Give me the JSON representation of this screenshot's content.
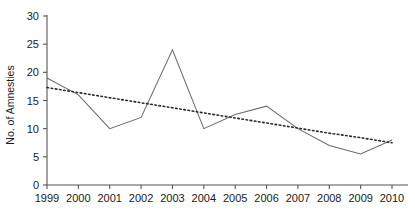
{
  "chart_data": {
    "type": "line",
    "title": "",
    "xlabel": "",
    "ylabel": "No. of Amnesties",
    "categories": [
      "1999",
      "2000",
      "2001",
      "2002",
      "2003",
      "2004",
      "2005",
      "2006",
      "2007",
      "2008",
      "2009",
      "2010"
    ],
    "x": [
      1999,
      2000,
      2001,
      2002,
      2003,
      2004,
      2005,
      2006,
      2007,
      2008,
      2009,
      2010
    ],
    "ylim": [
      0,
      30
    ],
    "xlim": [
      1999,
      2010
    ],
    "yticks": [
      0,
      5,
      10,
      15,
      20,
      25,
      30
    ],
    "ytick_labels": [
      "0",
      "5",
      "10",
      "15",
      "20",
      "25",
      "30"
    ],
    "grid": false,
    "legend": "none",
    "series": [
      {
        "name": "No. of Amnesties",
        "style": "solid",
        "color": "#6b6b6b",
        "values": [
          19,
          16,
          10,
          12,
          24,
          10,
          12.5,
          14,
          10,
          7,
          5.5,
          8
        ]
      },
      {
        "name": "Linear trend",
        "style": "dotted",
        "color": "#2b2b2b",
        "values": [
          17.3,
          16.4,
          15.5,
          14.6,
          13.7,
          12.8,
          11.9,
          11.0,
          10.1,
          9.2,
          8.4,
          7.5
        ]
      }
    ]
  },
  "axes": {
    "y_title": "No. of Amnesties"
  }
}
